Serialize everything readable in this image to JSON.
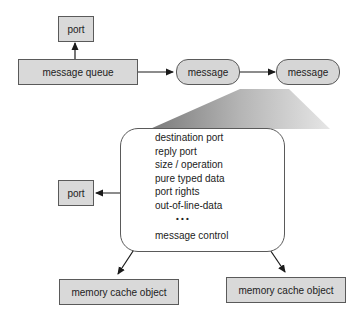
{
  "diagram": {
    "nodes": {
      "port_top": "port",
      "message_queue": "message queue",
      "message_1": "message",
      "message_2": "message",
      "port_left": "port",
      "memory_cache_left": "memory cache object",
      "memory_cache_right": "memory cache object"
    },
    "message_fields": [
      "destination port",
      "reply port",
      "size / operation",
      "pure typed data",
      "port rights",
      "out-of-line-data",
      "• • •",
      "message control"
    ],
    "edges": [
      {
        "from": "message_queue",
        "to": "port_top"
      },
      {
        "from": "message_queue",
        "to": "message_1"
      },
      {
        "from": "message_1",
        "to": "message_2"
      },
      {
        "from": "port rights",
        "to": "port_left"
      },
      {
        "from": "out-of-line-data",
        "to": "memory_cache_left"
      },
      {
        "from": "out-of-line-data",
        "to": "memory_cache_right"
      }
    ],
    "colors": {
      "node_fill": "#d9d9d9",
      "stroke": "#5a5a5a",
      "arrow": "#1a1a1a"
    }
  }
}
